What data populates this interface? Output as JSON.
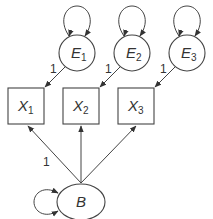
{
  "diagram": {
    "type": "path-diagram",
    "error_nodes": [
      {
        "id": "E1",
        "letter": "E",
        "sub": "1",
        "loading": "1"
      },
      {
        "id": "E2",
        "letter": "E",
        "sub": "2",
        "loading": "1"
      },
      {
        "id": "E3",
        "letter": "E",
        "sub": "3",
        "loading": "1"
      }
    ],
    "observed_nodes": [
      {
        "id": "X1",
        "letter": "X",
        "sub": "1"
      },
      {
        "id": "X2",
        "letter": "X",
        "sub": "2"
      },
      {
        "id": "X3",
        "letter": "X",
        "sub": "3"
      }
    ],
    "latent_node": {
      "id": "B",
      "letter": "B"
    },
    "latent_loading_label": "1",
    "colors": {
      "stroke": "#444444",
      "text": "#333333",
      "background": "#ffffff"
    }
  }
}
